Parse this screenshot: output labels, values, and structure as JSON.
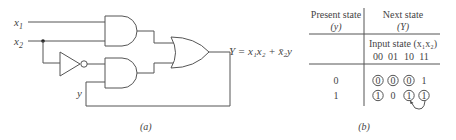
{
  "circuit": {
    "inputs": [
      {
        "name": "x",
        "sub": "1"
      },
      {
        "name": "x",
        "sub": "2"
      }
    ],
    "feedback_label": "y",
    "output_equation": "Y = x₁x₂ + x̄₂y",
    "caption": "(a)",
    "gates": [
      "AND",
      "NOT",
      "AND",
      "OR"
    ]
  },
  "table": {
    "header_left_line1": "Present state",
    "header_left_line2": "(y)",
    "header_right_line1": "Next state",
    "header_right_line2": "(Y)",
    "input_state_label": "Input state (x₁x₂)",
    "columns": [
      "00",
      "01",
      "10",
      "11"
    ],
    "rows": [
      {
        "present": "0",
        "next": [
          "0",
          "0",
          "0",
          "1"
        ],
        "circled": [
          true,
          true,
          true,
          false
        ]
      },
      {
        "present": "1",
        "next": [
          "1",
          "0",
          "1",
          "1"
        ],
        "circled": [
          true,
          false,
          true,
          true
        ]
      }
    ],
    "arrow": {
      "from": "row1-col11",
      "to": "row1-col10"
    },
    "caption": "(b)"
  }
}
